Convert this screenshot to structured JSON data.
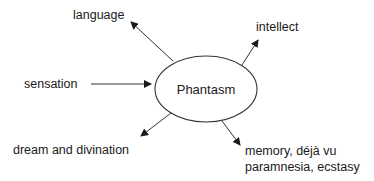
{
  "diagram": {
    "center": {
      "label": "Phantasm"
    },
    "nodes": [
      {
        "id": "language",
        "label": "language",
        "direction": "outgoing"
      },
      {
        "id": "intellect",
        "label": "intellect",
        "direction": "outgoing"
      },
      {
        "id": "sensation",
        "label": "sensation",
        "direction": "incoming"
      },
      {
        "id": "dream",
        "label": "dream and divination",
        "direction": "outgoing"
      },
      {
        "id": "memory",
        "label_line1": "memory, déjà vu",
        "label_line2": "paramnesia, ecstasy",
        "direction": "outgoing"
      }
    ],
    "colors": {
      "stroke": "#333333",
      "text": "#1a1a1a",
      "background": "#ffffff"
    }
  }
}
